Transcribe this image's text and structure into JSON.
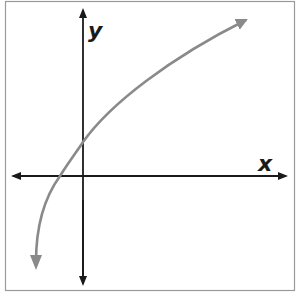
{
  "diagram": {
    "type": "function-graph",
    "x_axis_label": "x",
    "y_axis_label": "y",
    "colors": {
      "frame": "#9a9a9a",
      "axes": "#1a1a1a",
      "curve": "#8a8a8a",
      "background": "#ffffff"
    },
    "curve": {
      "shape": "logarithmic",
      "crosses_x_axis": "left of origin",
      "crosses_y_axis": "above origin",
      "end_behavior_left": "approaches vertical asymptote, heading down",
      "end_behavior_right": "increasing slowly, arrow up-right"
    }
  }
}
